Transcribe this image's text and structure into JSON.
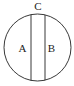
{
  "diagram": {
    "type": "circle-divided-by-two-parallel-chords",
    "labels": {
      "top": "C",
      "left_region": "A",
      "right_region": "B"
    },
    "stroke_color": "#222222",
    "background": "#ffffff"
  }
}
